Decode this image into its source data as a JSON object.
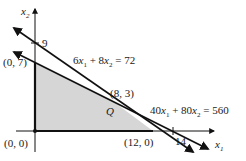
{
  "diagram": {
    "type": "linear-programming-feasible-region",
    "axes": {
      "x_label": "x1",
      "y_label": "x2",
      "x_tick": "14",
      "y_tick": "9"
    },
    "constraints": [
      {
        "id": "c1",
        "label": "6x1 + 8x2 = 72",
        "lhs_a": "6",
        "lhs_b": "8",
        "rhs": "72",
        "intercepts": {
          "x1": 12,
          "x2": 9
        }
      },
      {
        "id": "c2",
        "label": "40x1 + 80x2 = 560",
        "lhs_a": "40",
        "lhs_b": "80",
        "rhs": "560",
        "intercepts": {
          "x1": 14,
          "x2": 7
        }
      }
    ],
    "feasible_region": {
      "vertices": [
        [
          0,
          0
        ],
        [
          0,
          7
        ],
        [
          8,
          3
        ],
        [
          12,
          0
        ]
      ],
      "fill_color": "#d6d6d6"
    },
    "points": [
      {
        "label": "(0, 0)",
        "x": 0,
        "y": 0
      },
      {
        "label": "(0, 7)",
        "x": 0,
        "y": 7
      },
      {
        "label": "(8, 3)",
        "x": 8,
        "y": 3
      },
      {
        "label": "(12, 0)",
        "x": 12,
        "y": 0
      }
    ],
    "point_q_label": "Q",
    "line_color": "#111111"
  }
}
